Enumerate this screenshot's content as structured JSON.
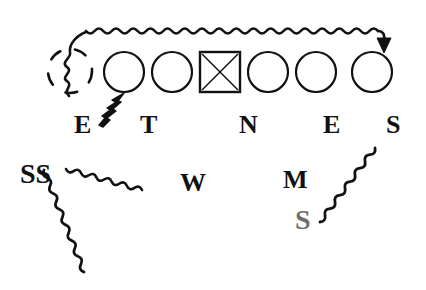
{
  "figure": {
    "background_color": "#ffffff",
    "ink_color": "#111111",
    "grey_ink_color": "#6e6e6e",
    "width": 426,
    "height": 290
  },
  "nodes": [
    {
      "id": "node-ghost",
      "shape": "dashed-circle",
      "cx": 70,
      "cy": 71,
      "r": 22,
      "filled": false,
      "stroke": "#111111",
      "label": ""
    },
    {
      "id": "node-1",
      "shape": "circle",
      "cx": 124,
      "cy": 72,
      "r": 20,
      "filled": false,
      "stroke": "#111111",
      "label": "E"
    },
    {
      "id": "node-2",
      "shape": "circle",
      "cx": 172,
      "cy": 72,
      "r": 20,
      "filled": false,
      "stroke": "#111111",
      "label": "T"
    },
    {
      "id": "node-3",
      "shape": "square-x",
      "cx": 220,
      "cy": 72,
      "r": 20,
      "filled": false,
      "stroke": "#111111",
      "label": "N"
    },
    {
      "id": "node-4",
      "shape": "circle",
      "cx": 268,
      "cy": 72,
      "r": 20,
      "filled": false,
      "stroke": "#111111",
      "label": ""
    },
    {
      "id": "node-5",
      "shape": "circle",
      "cx": 316,
      "cy": 72,
      "r": 20,
      "filled": false,
      "stroke": "#111111",
      "label": "E"
    },
    {
      "id": "node-6",
      "shape": "circle",
      "cx": 372,
      "cy": 72,
      "r": 20,
      "filled": false,
      "stroke": "#111111",
      "label": "S"
    }
  ],
  "labels": [
    {
      "id": "label-E1",
      "text": "E",
      "x": 74,
      "y": 112,
      "size": 26,
      "color": "#111111"
    },
    {
      "id": "label-T",
      "text": "T",
      "x": 140,
      "y": 112,
      "size": 26,
      "color": "#111111"
    },
    {
      "id": "label-N",
      "text": "N",
      "x": 239,
      "y": 112,
      "size": 26,
      "color": "#111111"
    },
    {
      "id": "label-E2",
      "text": "E",
      "x": 323,
      "y": 112,
      "size": 26,
      "color": "#111111"
    },
    {
      "id": "label-S1",
      "text": "S",
      "x": 386,
      "y": 112,
      "size": 26,
      "color": "#111111"
    },
    {
      "id": "label-SS",
      "text": "SS",
      "x": 20,
      "y": 160,
      "size": 28,
      "color": "#111111"
    },
    {
      "id": "label-W",
      "text": "W",
      "x": 180,
      "y": 170,
      "size": 26,
      "color": "#111111"
    },
    {
      "id": "label-M",
      "text": "M",
      "x": 283,
      "y": 167,
      "size": 26,
      "color": "#111111"
    },
    {
      "id": "label-S2",
      "text": "S",
      "x": 295,
      "y": 206,
      "size": 28,
      "color": "#6e6e6e"
    }
  ],
  "connectors": [
    {
      "id": "connector-top",
      "style": "wavy",
      "arrowhead": "end-down",
      "description": "long wavy line across the top ending with an arrow onto the last circle",
      "from": {
        "x": 68,
        "y": 95
      },
      "to": {
        "x": 382,
        "y": 48
      }
    },
    {
      "id": "connector-zigzag",
      "style": "zigzag-bold",
      "arrowhead": "end-up-right",
      "description": "short jagged arrow pointing up-right to the first circle",
      "from": {
        "x": 100,
        "y": 122
      },
      "to": {
        "x": 124,
        "y": 96
      }
    },
    {
      "id": "connector-ss-right",
      "style": "wavy",
      "arrowhead": "none",
      "description": "wavy line from SS going right and slightly down",
      "from": {
        "x": 66,
        "y": 169
      },
      "to": {
        "x": 142,
        "y": 190
      }
    },
    {
      "id": "connector-ss-down",
      "style": "wavy",
      "arrowhead": "none",
      "description": "wavy line from SS going down and to the right",
      "from": {
        "x": 44,
        "y": 170
      },
      "to": {
        "x": 84,
        "y": 272
      }
    },
    {
      "id": "connector-s-up",
      "style": "wavy",
      "arrowhead": "none",
      "description": "wavy line from the grey S going up and to the right",
      "from": {
        "x": 320,
        "y": 222
      },
      "to": {
        "x": 375,
        "y": 148
      }
    }
  ]
}
